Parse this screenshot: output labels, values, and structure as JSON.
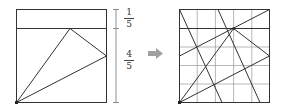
{
  "left_figure": {
    "label_top": {
      "numerator": "1",
      "denominator": "5"
    },
    "label_bottom": {
      "numerator": "4",
      "denominator": "5"
    }
  },
  "arrow": {
    "icon": "right-arrow-icon",
    "color": "#a0a0a0"
  },
  "right_figure": {
    "grid": "5x5"
  },
  "colors": {
    "line": "#333333",
    "grid": "#9a9a9a",
    "bracket": "#777777"
  }
}
